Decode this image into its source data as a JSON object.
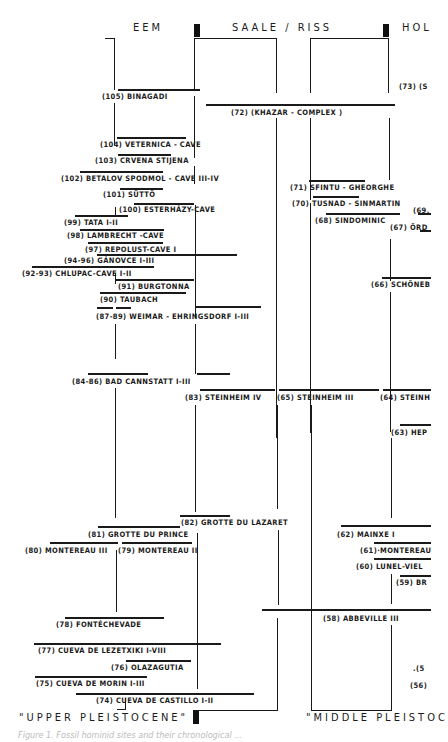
{
  "headers": {
    "eem": "EEM",
    "saale_riss": "SAALE / RISS",
    "hol": "HOL"
  },
  "footer": {
    "upper": "\"UPPER  PLEISTOCENE\"",
    "middle": "\"MIDDLE  PLEISTOC",
    "caption": "Figure 1.  Fossil hominid sites and their chronological ..."
  },
  "sites": [
    {
      "id": "105",
      "label": "(105) BINAGADI"
    },
    {
      "id": "104",
      "label": "(104) VETERNICA - CAVE"
    },
    {
      "id": "103",
      "label": "(103) CRVENA  STIJENA"
    },
    {
      "id": "102",
      "label": "(102) BETALOV SPODMOL - CAVE III-IV"
    },
    {
      "id": "101",
      "label": "(101) SÜTTÖ"
    },
    {
      "id": "100",
      "label": "(100) ESTERHÁZY-CAVE"
    },
    {
      "id": "99",
      "label": "(99)  TATA  I-II"
    },
    {
      "id": "98",
      "label": "(98) LAMBRECHT  -CAVE"
    },
    {
      "id": "97",
      "label": "(97) REPOLUST-CAVE I"
    },
    {
      "id": "94-96",
      "label": "(94-96) GÁNOVCE  I-III"
    },
    {
      "id": "92-93",
      "label": "(92-93) CHLUPAC-CAVE  I-II"
    },
    {
      "id": "91",
      "label": "(91) BURGTONNA"
    },
    {
      "id": "90",
      "label": "(90)  TAUBACH"
    },
    {
      "id": "87-89",
      "label": "(87-89) WEIMAR - EHRINGSDORF  I-III"
    },
    {
      "id": "84-86",
      "label": "(84-86) BAD CANNSTATT  I-III"
    },
    {
      "id": "83",
      "label": "(83) STEINHEIM IV"
    },
    {
      "id": "82",
      "label": "(82) GROTTE DU LAZARET"
    },
    {
      "id": "81",
      "label": "(81)  GROTTE DU PRINCE"
    },
    {
      "id": "80",
      "label": "(80) MONTEREAU III"
    },
    {
      "id": "79",
      "label": "(79) MONTEREAU II"
    },
    {
      "id": "78",
      "label": "(78) FONTÉCHEVADE"
    },
    {
      "id": "77",
      "label": "(77)  CUEVA  DE LEZETXIKI  I-VIII"
    },
    {
      "id": "76",
      "label": "(76) OLAZAGUTIA"
    },
    {
      "id": "75",
      "label": "(75) CUEVA DE MORIN  I-III"
    },
    {
      "id": "74",
      "label": "(74)  CUEVA  DE  CASTILLO  I-II"
    },
    {
      "id": "73",
      "label": "(73) (S"
    },
    {
      "id": "72",
      "label": "(72)  (KHAZAR - COMPLEX )"
    },
    {
      "id": "71",
      "label": "(71)  SFINTU - GHEORGHE"
    },
    {
      "id": "70",
      "label": "(70) TUSNAD - SINMARTIN"
    },
    {
      "id": "69",
      "label": "(69."
    },
    {
      "id": "68",
      "label": "(68) SINDOMINIC"
    },
    {
      "id": "67",
      "label": "(67) ÖRD"
    },
    {
      "id": "66",
      "label": "(66) SCHÖNEB"
    },
    {
      "id": "65",
      "label": "(65)  STEINHEIM  III"
    },
    {
      "id": "64",
      "label": "(64)  STEINH"
    },
    {
      "id": "63",
      "label": "(63)  HEP"
    },
    {
      "id": "62",
      "label": "(62)  MAINXE I"
    },
    {
      "id": "61",
      "label": "(61)·MONTEREAU"
    },
    {
      "id": "60",
      "label": "(60)  LUNEL-VIEL"
    },
    {
      "id": "59",
      "label": "(59) BR"
    },
    {
      "id": "58",
      "label": "(58)  ABBEVILLE  III"
    },
    {
      "id": "57",
      "label": ".(5"
    },
    {
      "id": "56",
      "label": "(56)"
    }
  ]
}
